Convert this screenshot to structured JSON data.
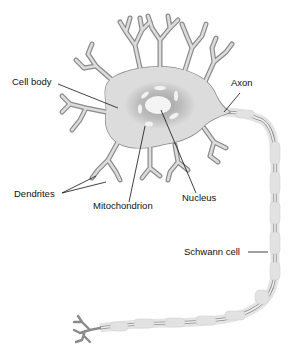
{
  "diagram": {
    "labels": {
      "cell_body": "Cell body",
      "axon": "Axon",
      "dendrites": "Dendrites",
      "mitochondrion": "Mitochondrion",
      "nucleus": "Nucleus",
      "schwann_cell": "Schwann cell"
    },
    "colors": {
      "cell_fill": "#dcdcdc",
      "outline": "#8a8a8a",
      "nucleus_shadow": "#b8b8b8",
      "nucleus_core": "#f2f2f2",
      "myelin": "#e6e6e6",
      "leader_line": "#111111"
    }
  }
}
